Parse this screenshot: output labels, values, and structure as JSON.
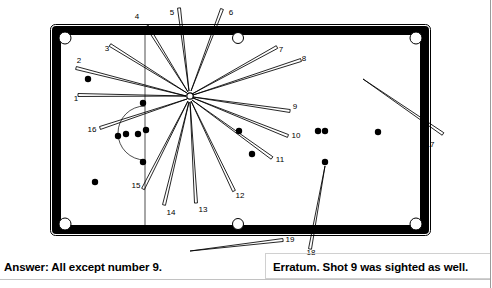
{
  "figure": {
    "type": "billiards-table-shot-diagram",
    "title_caption": "Answer: All except number 9.",
    "erratum_caption": "Erratum. Shot 9 was sighted as well.",
    "cue_ball": {
      "x": 190,
      "y": 96,
      "r": 3.2,
      "style": "hollow"
    },
    "table": {
      "outer": {
        "x": 52,
        "y": 26,
        "w": 377,
        "h": 208
      },
      "cushion_color": "#000000",
      "cloth_color": "#ffffff",
      "baulk_line_x": 145,
      "baulk_arc": {
        "cx": 145,
        "cy": 133,
        "r": 27
      }
    },
    "pockets": [
      {
        "name": "top-left",
        "x": 65,
        "y": 38
      },
      {
        "name": "top-middle",
        "x": 238,
        "y": 38
      },
      {
        "name": "top-right",
        "x": 416,
        "y": 38
      },
      {
        "name": "bottom-left",
        "x": 65,
        "y": 224
      },
      {
        "name": "bottom-middle",
        "x": 238,
        "y": 224
      },
      {
        "name": "bottom-right",
        "x": 416,
        "y": 224
      }
    ],
    "balls": [
      {
        "x": 88,
        "y": 79,
        "r": 3.2
      },
      {
        "x": 143,
        "y": 103,
        "r": 3.2
      },
      {
        "x": 118,
        "y": 136,
        "r": 3.2
      },
      {
        "x": 126,
        "y": 134,
        "r": 3.2
      },
      {
        "x": 138,
        "y": 134,
        "r": 3.2
      },
      {
        "x": 146,
        "y": 130,
        "r": 3.2
      },
      {
        "x": 143,
        "y": 162,
        "r": 3.2
      },
      {
        "x": 95,
        "y": 182,
        "r": 3.2
      },
      {
        "x": 239,
        "y": 131,
        "r": 3.2
      },
      {
        "x": 252,
        "y": 154,
        "r": 3.2
      },
      {
        "x": 318,
        "y": 131,
        "r": 3.2
      },
      {
        "x": 325,
        "y": 131,
        "r": 3.2
      },
      {
        "x": 378,
        "y": 132,
        "r": 3.2
      },
      {
        "x": 325,
        "y": 162,
        "r": 3.2
      }
    ],
    "shots": [
      {
        "n": "1",
        "label_x": 76,
        "label_y": 101,
        "x1": 186,
        "y1": 96,
        "x2": 78,
        "y2": 95
      },
      {
        "n": "2",
        "label_x": 79,
        "label_y": 63,
        "x1": 186,
        "y1": 96,
        "x2": 76,
        "y2": 68
      },
      {
        "n": "3",
        "label_x": 107,
        "label_y": 51,
        "x1": 187,
        "y1": 93,
        "x2": 110,
        "y2": 45
      },
      {
        "n": "4",
        "label_x": 137,
        "label_y": 19,
        "x1": 188,
        "y1": 92,
        "x2": 147,
        "y2": 26
      },
      {
        "n": "5",
        "label_x": 172,
        "label_y": 15,
        "x1": 189,
        "y1": 91,
        "x2": 179,
        "y2": 8
      },
      {
        "n": "6",
        "label_x": 231,
        "label_y": 15,
        "x1": 191,
        "y1": 91,
        "x2": 222,
        "y2": 9
      },
      {
        "n": "7",
        "label_x": 281,
        "label_y": 52,
        "x1": 192,
        "y1": 94,
        "x2": 277,
        "y2": 47
      },
      {
        "n": "8",
        "label_x": 304,
        "label_y": 61,
        "x1": 193,
        "y1": 95,
        "x2": 301,
        "y2": 60
      },
      {
        "n": "9",
        "label_x": 295,
        "label_y": 109,
        "x1": 193,
        "y1": 97,
        "x2": 290,
        "y2": 111
      },
      {
        "n": "10",
        "label_x": 296,
        "label_y": 138,
        "x1": 193,
        "y1": 98,
        "x2": 288,
        "y2": 136
      },
      {
        "n": "11",
        "label_x": 280,
        "label_y": 162,
        "x1": 192,
        "y1": 100,
        "x2": 272,
        "y2": 158
      },
      {
        "n": "12",
        "label_x": 240,
        "label_y": 198,
        "x1": 191,
        "y1": 101,
        "x2": 234,
        "y2": 191
      },
      {
        "n": "13",
        "label_x": 203,
        "label_y": 212,
        "x1": 190,
        "y1": 102,
        "x2": 196,
        "y2": 203
      },
      {
        "n": "14",
        "label_x": 171,
        "label_y": 215,
        "x1": 189,
        "y1": 102,
        "x2": 164,
        "y2": 205
      },
      {
        "n": "15",
        "label_x": 136,
        "label_y": 188,
        "x1": 188,
        "y1": 101,
        "x2": 143,
        "y2": 189
      },
      {
        "n": "16",
        "label_x": 92,
        "label_y": 132,
        "x1": 187,
        "y1": 99,
        "x2": 100,
        "y2": 128
      },
      {
        "n": "17",
        "label_x": 430,
        "label_y": 147,
        "x1": 363,
        "y1": 79,
        "x2": 443,
        "y2": 134
      },
      {
        "n": "18",
        "label_x": 311,
        "label_y": 255,
        "x1": 325,
        "y1": 166,
        "x2": 310,
        "y2": 249
      },
      {
        "n": "19",
        "label_x": 290,
        "label_y": 242,
        "x1": 190,
        "y1": 251,
        "x2": 283,
        "y2": 240
      }
    ]
  }
}
